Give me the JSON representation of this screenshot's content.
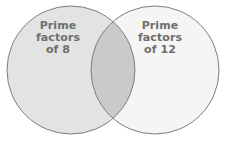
{
  "figure": {
    "type": "venn-diagram",
    "background_color": "#ffffff",
    "stroke_color": "#7d7d7d",
    "stroke_width": 1,
    "text_color": "#6e6e6e"
  },
  "sets": {
    "left": {
      "name": "prime-factors-of-8",
      "fill_color": "#e3e3e3",
      "label_lines": [
        "Prime",
        "factors",
        "of 8"
      ],
      "line1": "Prime",
      "line2": "factors",
      "line3": "of 8",
      "cx": 71,
      "cy": 70,
      "r": 64
    },
    "right": {
      "name": "prime-factors-of-12",
      "fill_color": "#f5f5f5",
      "label_lines": [
        "Prime",
        "factors",
        "of 12"
      ],
      "line1": "Prime",
      "line2": "factors",
      "line3": "of 12",
      "cx": 155,
      "cy": 70,
      "r": 64
    },
    "intersection": {
      "name": "intersection-region",
      "fill_color": "#cacaca",
      "label_lines": []
    }
  }
}
